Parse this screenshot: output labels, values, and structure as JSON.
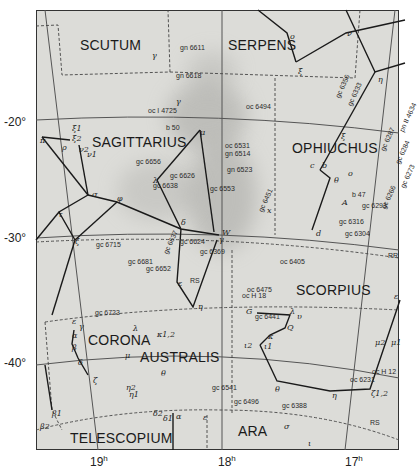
{
  "map": {
    "type": "star_chart",
    "region": "Sagittarius / Scorpius region",
    "dec_labels": [
      {
        "label": "-20°",
        "y": 122
      },
      {
        "label": "-30°",
        "y": 238
      },
      {
        "label": "-40°",
        "y": 363
      }
    ],
    "ra_labels": [
      {
        "label": "19",
        "sup": "h",
        "x": 90
      },
      {
        "label": "18",
        "sup": "h",
        "x": 218
      },
      {
        "label": "17",
        "sup": "h",
        "x": 345
      }
    ],
    "constellations": [
      {
        "name": "SCUTUM",
        "x": 80,
        "y": 38
      },
      {
        "name": "SERPENS",
        "x": 228,
        "y": 38
      },
      {
        "name": "SAGITTARIUS",
        "x": 92,
        "y": 135
      },
      {
        "name": "OPHIUCHUS",
        "x": 292,
        "y": 141
      },
      {
        "name": "SCORPIUS",
        "x": 296,
        "y": 283
      },
      {
        "name": "CORONA",
        "x": 88,
        "y": 333
      },
      {
        "name": "AUSTRALIS",
        "x": 140,
        "y": 350
      },
      {
        "name": "TELESCOPIUM",
        "x": 70,
        "y": 431
      },
      {
        "name": "ARA",
        "x": 238,
        "y": 424
      }
    ],
    "deep_sky_objects": [
      {
        "label": "gn 6611",
        "x": 180,
        "y": 44
      },
      {
        "label": "gn 6618",
        "x": 176,
        "y": 72
      },
      {
        "label": "oc I 4725",
        "x": 148,
        "y": 107
      },
      {
        "label": "oc 6494",
        "x": 246,
        "y": 103
      },
      {
        "label": "b 50",
        "x": 166,
        "y": 124
      },
      {
        "label": "oc 6531",
        "x": 225,
        "y": 142
      },
      {
        "label": "gn 6514",
        "x": 225,
        "y": 150
      },
      {
        "label": "gn 6523",
        "x": 227,
        "y": 166
      },
      {
        "label": "gc 6656",
        "x": 136,
        "y": 158
      },
      {
        "label": "gc 6626",
        "x": 170,
        "y": 172
      },
      {
        "label": "gc 6638",
        "x": 153,
        "y": 182
      },
      {
        "label": "gc 6553",
        "x": 210,
        "y": 185
      },
      {
        "label": "gc 6715",
        "x": 96,
        "y": 241
      },
      {
        "label": "gc 6624",
        "x": 180,
        "y": 238
      },
      {
        "label": "gc 6681",
        "x": 128,
        "y": 258
      },
      {
        "label": "gc 6652",
        "x": 146,
        "y": 265
      },
      {
        "label": "gc 6369",
        "x": 200,
        "y": 248
      },
      {
        "label": "RS",
        "x": 190,
        "y": 277
      },
      {
        "label": "oc 6405",
        "x": 280,
        "y": 258
      },
      {
        "label": "oc 6475",
        "x": 247,
        "y": 286
      },
      {
        "label": "oc H 18",
        "x": 242,
        "y": 292
      },
      {
        "label": "gc 6441",
        "x": 255,
        "y": 313
      },
      {
        "label": "gc 6723",
        "x": 95,
        "y": 309
      },
      {
        "label": "gc 6316",
        "x": 339,
        "y": 218
      },
      {
        "label": "gc 6293",
        "x": 362,
        "y": 202
      },
      {
        "label": "gc 6304",
        "x": 345,
        "y": 230
      },
      {
        "label": "RR",
        "x": 388,
        "y": 252
      },
      {
        "label": "b 47",
        "x": 352,
        "y": 191
      },
      {
        "label": "oc H 12",
        "x": 372,
        "y": 368
      },
      {
        "label": "oc 6231",
        "x": 350,
        "y": 376
      },
      {
        "label": "gc 6541",
        "x": 212,
        "y": 384
      },
      {
        "label": "gc 6496",
        "x": 234,
        "y": 398
      },
      {
        "label": "gc 6388",
        "x": 282,
        "y": 402
      },
      {
        "label": "RS",
        "x": 370,
        "y": 419
      }
    ],
    "rotated_objects": [
      {
        "label": "gc 6356",
        "x": 334,
        "y": 96
      },
      {
        "label": "gc 6333",
        "x": 346,
        "y": 104
      },
      {
        "label": "gc 6287",
        "x": 379,
        "y": 149
      },
      {
        "label": "pn II 4634",
        "x": 398,
        "y": 130
      },
      {
        "label": "gc 6284",
        "x": 394,
        "y": 162
      },
      {
        "label": "gc 6273",
        "x": 399,
        "y": 186
      },
      {
        "label": "gc 6266",
        "x": 380,
        "y": 207
      },
      {
        "label": "gc 6451",
        "x": 257,
        "y": 210
      },
      {
        "label": "gc 6637",
        "x": 162,
        "y": 252
      }
    ],
    "stars": [
      {
        "label": "γ",
        "x": 152,
        "y": 52
      },
      {
        "label": "γ",
        "x": 176,
        "y": 98
      },
      {
        "label": "o",
        "x": 290,
        "y": 33
      },
      {
        "label": "ν",
        "x": 347,
        "y": 30
      },
      {
        "label": "ξ",
        "x": 298,
        "y": 68
      },
      {
        "label": "η",
        "x": 378,
        "y": 76
      },
      {
        "label": "μ",
        "x": 200,
        "y": 129
      },
      {
        "label": "ξ1",
        "x": 72,
        "y": 125
      },
      {
        "label": "ξ2",
        "x": 72,
        "y": 135
      },
      {
        "label": "π",
        "x": 40,
        "y": 137
      },
      {
        "label": "ρ",
        "x": 62,
        "y": 144
      },
      {
        "label": "ν2",
        "x": 79,
        "y": 146
      },
      {
        "label": "ν1",
        "x": 87,
        "y": 151
      },
      {
        "label": "λ",
        "x": 153,
        "y": 177
      },
      {
        "label": "σ",
        "x": 92,
        "y": 191
      },
      {
        "label": "φ",
        "x": 117,
        "y": 195
      },
      {
        "label": "τ",
        "x": 58,
        "y": 211
      },
      {
        "label": "δ",
        "x": 181,
        "y": 219
      },
      {
        "label": "ζ",
        "x": 75,
        "y": 238
      },
      {
        "label": "W",
        "x": 222,
        "y": 229
      },
      {
        "label": "γ",
        "x": 219,
        "y": 236
      },
      {
        "label": "x",
        "x": 267,
        "y": 207
      },
      {
        "label": "ξ",
        "x": 341,
        "y": 133
      },
      {
        "label": "c",
        "x": 310,
        "y": 162
      },
      {
        "label": "b",
        "x": 322,
        "y": 162
      },
      {
        "label": "θ",
        "x": 334,
        "y": 177
      },
      {
        "label": "o",
        "x": 348,
        "y": 170
      },
      {
        "label": "A",
        "x": 342,
        "y": 199
      },
      {
        "label": "d",
        "x": 316,
        "y": 230
      },
      {
        "label": "ε",
        "x": 178,
        "y": 280
      },
      {
        "label": "η",
        "x": 198,
        "y": 303
      },
      {
        "label": "ε",
        "x": 394,
        "y": 293
      },
      {
        "label": "G",
        "x": 246,
        "y": 308
      },
      {
        "label": "λ",
        "x": 290,
        "y": 308
      },
      {
        "label": "υ",
        "x": 297,
        "y": 313
      },
      {
        "label": "Q",
        "x": 287,
        "y": 324
      },
      {
        "label": "κ",
        "x": 268,
        "y": 333
      },
      {
        "label": "ι2",
        "x": 244,
        "y": 342
      },
      {
        "label": "ι1",
        "x": 264,
        "y": 343
      },
      {
        "label": "θ",
        "x": 275,
        "y": 386
      },
      {
        "label": "η",
        "x": 332,
        "y": 392
      },
      {
        "label": "ζ1,2",
        "x": 371,
        "y": 390
      },
      {
        "label": "μ2",
        "x": 375,
        "y": 339
      },
      {
        "label": "μ1",
        "x": 391,
        "y": 339
      },
      {
        "label": "σ",
        "x": 284,
        "y": 423
      },
      {
        "label": "ι",
        "x": 308,
        "y": 440
      },
      {
        "label": "ε",
        "x": 72,
        "y": 318
      },
      {
        "label": "γ",
        "x": 79,
        "y": 323
      },
      {
        "label": "α",
        "x": 72,
        "y": 332
      },
      {
        "label": "β",
        "x": 72,
        "y": 344
      },
      {
        "label": "δ",
        "x": 78,
        "y": 359
      },
      {
        "label": "ζ",
        "x": 93,
        "y": 377
      },
      {
        "label": "λ",
        "x": 133,
        "y": 325
      },
      {
        "label": "κ1,2",
        "x": 157,
        "y": 331
      },
      {
        "label": "μ",
        "x": 125,
        "y": 352
      },
      {
        "label": "θ",
        "x": 161,
        "y": 370
      },
      {
        "label": "η2",
        "x": 126,
        "y": 384
      },
      {
        "label": "η1",
        "x": 129,
        "y": 391
      },
      {
        "label": "β1",
        "x": 52,
        "y": 410
      },
      {
        "label": "β2",
        "x": 40,
        "y": 423
      },
      {
        "label": "δ2",
        "x": 153,
        "y": 410
      },
      {
        "label": "δ1",
        "x": 163,
        "y": 415
      },
      {
        "label": "α",
        "x": 176,
        "y": 413
      },
      {
        "label": "ε",
        "x": 203,
        "y": 414
      }
    ]
  }
}
